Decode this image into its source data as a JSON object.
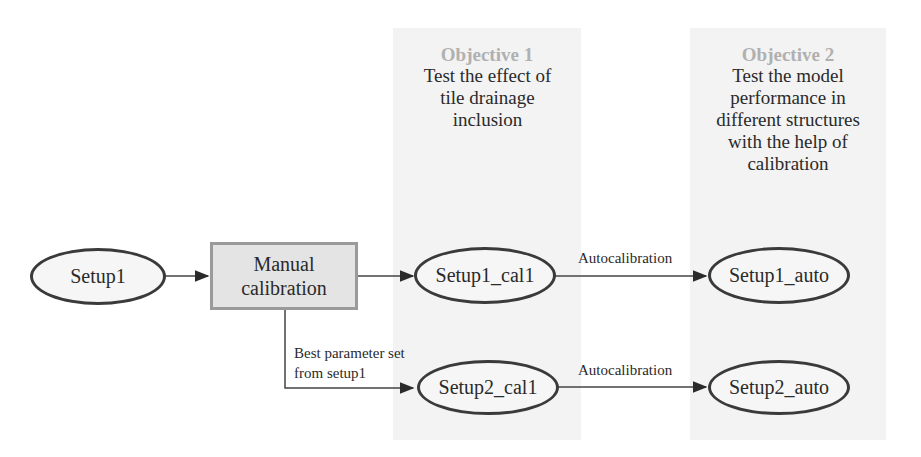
{
  "objectives": [
    {
      "title": "Objective 1",
      "description": "Test the effect of tile drainage inclusion"
    },
    {
      "title": "Objective 2",
      "description": "Test the model performance in different structures with the help of calibration"
    }
  ],
  "nodes": {
    "setup1": "Setup1",
    "manual_calibration": "Manual calibration",
    "setup1_cal1": "Setup1_cal1",
    "setup2_cal1": "Setup2_cal1",
    "setup1_auto": "Setup1_auto",
    "setup2_auto": "Setup2_auto"
  },
  "edges": {
    "best_param_label": "Best parameter set from setup1",
    "autocal_label_1": "Autocalibration",
    "autocal_label_2": "Autocalibration"
  },
  "colors": {
    "panel": "#f3f3f3",
    "node_border": "#3a3a3a",
    "box_fill": "#e4e4e4",
    "heading": "#b0b0b0"
  }
}
